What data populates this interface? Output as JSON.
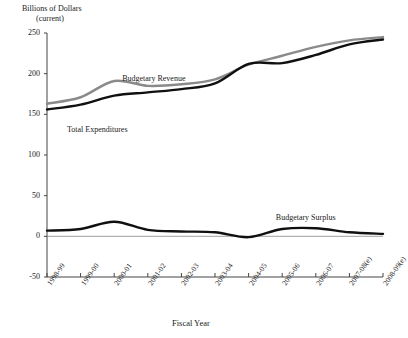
{
  "chart_data": {
    "type": "line",
    "title": "",
    "ylabel": "Billions of Dollars",
    "ylabel_sub": "(current)",
    "xlabel": "Fiscal Year",
    "ylim": [
      -50,
      250
    ],
    "yticks": [
      250,
      200,
      150,
      100,
      50,
      0,
      -50
    ],
    "grid": false,
    "legend_position": "inline-annotations",
    "categories": [
      "1998-99",
      "1999-00",
      "2000-01",
      "2001-02",
      "2002-03",
      "2003-04",
      "2004-05",
      "2005-06",
      "2006-07",
      "2007-08(e)",
      "2008-09(e)"
    ],
    "series": [
      {
        "name": "Budgetary Revenue",
        "color": "#8a8a8a",
        "values": [
          163,
          171,
          191,
          185,
          187,
          193,
          211,
          222,
          233,
          241,
          245
        ]
      },
      {
        "name": "Total Expenditures",
        "color": "#101010",
        "values": [
          156,
          162,
          173,
          177,
          181,
          188,
          212,
          213,
          223,
          236,
          242
        ]
      },
      {
        "name": "Budgetary Surplus",
        "color": "#101010",
        "values": [
          7,
          9,
          18,
          8,
          6,
          5,
          -1,
          9,
          10,
          5,
          3
        ]
      }
    ],
    "annotations": [
      {
        "text": "Budgetary Revenue",
        "x": 0.31,
        "y": 0.22
      },
      {
        "text": "Total Expenditures",
        "x": 0.17,
        "y": 0.37
      },
      {
        "text": "Budgetary Surplus",
        "x": 0.7,
        "y": 0.63
      }
    ]
  }
}
